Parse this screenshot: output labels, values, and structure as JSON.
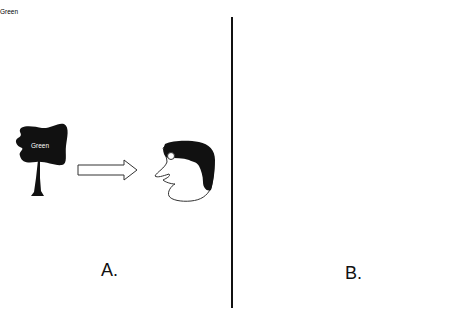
{
  "figure": {
    "panels": [
      {
        "id": "A",
        "label": "A.",
        "tree": {
          "style": "filled",
          "word": "Green"
        },
        "arrow": "right",
        "observer": "face-profile"
      },
      {
        "id": "B",
        "label": "B.",
        "thought_bubble": {
          "bubbles": 5,
          "content": {
            "tree": {
              "style": "filled",
              "word": "Green"
            }
          }
        },
        "tree": {
          "style": "outline",
          "word": ""
        },
        "arrow": "right",
        "observer": "face-profile"
      }
    ],
    "colors": {
      "ink": "#111111",
      "background": "#ffffff",
      "line": "#555555"
    }
  }
}
